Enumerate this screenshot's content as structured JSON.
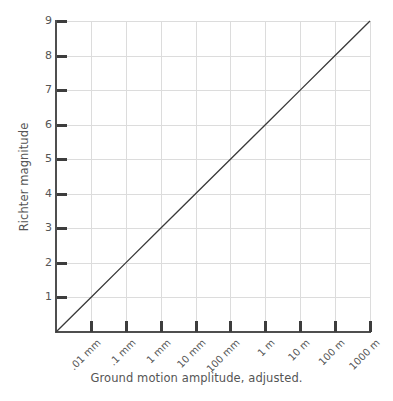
{
  "chart_data": {
    "type": "line",
    "title": "",
    "xlabel": "Ground motion amplitude, adjusted.",
    "ylabel": "Richter magnitude",
    "xtick_labels": [
      ".01 mm",
      ".1 mm",
      "1 mm",
      "10 mm",
      "100 mm",
      "1 m",
      "10 m",
      "100 m",
      "1000 m"
    ],
    "ytick_labels": [
      "1",
      "2",
      "3",
      "4",
      "5",
      "6",
      "7",
      "8",
      "9"
    ],
    "ylim": [
      0,
      9
    ],
    "xlim": [
      0,
      9
    ],
    "grid": true,
    "legend": "none",
    "series": [
      {
        "name": "Richter magnitude vs ground motion amplitude",
        "x": [
          0,
          1,
          2,
          3,
          4,
          5,
          6,
          7,
          8,
          9
        ],
        "values": [
          0,
          1,
          2,
          3,
          4,
          5,
          6,
          7,
          8,
          9
        ]
      }
    ],
    "annotation": "Straight diagonal line from origin (amplitude .001 mm decade, magnitude 0) to magnitude 9 at 1000 m",
    "colors": {
      "line": "#3a3a3a",
      "grid": "#dcdcdc",
      "spine": "#4f4f4f",
      "text": "#555555",
      "background": "#ffffff"
    }
  }
}
